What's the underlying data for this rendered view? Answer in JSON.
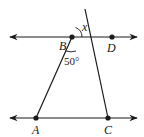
{
  "diagram": {
    "type": "geometry",
    "points": [
      {
        "name": "A",
        "label": "A"
      },
      {
        "name": "B",
        "label": "B"
      },
      {
        "name": "C",
        "label": "C"
      },
      {
        "name": "D",
        "label": "D"
      }
    ],
    "angles": {
      "at_B": "50°",
      "unknown": "x"
    },
    "colors": {
      "line": "#1a1a1a",
      "background": "#ffffff"
    }
  }
}
